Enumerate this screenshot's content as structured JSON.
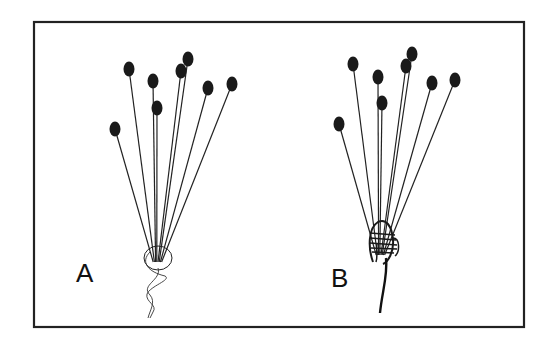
{
  "figure": {
    "panels": [
      {
        "label": "A",
        "description": "untied bundle of stalks with loose twisted thread",
        "base": [
          158,
          262
        ],
        "heads": [
          [
            115,
            129
          ],
          [
            129,
            69
          ],
          [
            153,
            81
          ],
          [
            157,
            108
          ],
          [
            181,
            71
          ],
          [
            188,
            59
          ],
          [
            208,
            88
          ],
          [
            232,
            84
          ]
        ]
      },
      {
        "label": "B",
        "description": "bundle of stalks wound and tied at base",
        "base": [
          381,
          255
        ],
        "heads": [
          [
            339,
            124
          ],
          [
            353,
            64
          ],
          [
            378,
            77
          ],
          [
            382,
            103
          ],
          [
            406,
            66
          ],
          [
            412,
            54
          ],
          [
            432,
            83
          ],
          [
            455,
            80
          ]
        ]
      }
    ],
    "colors": {
      "ink": "#1a1a1a",
      "frame": "#222222",
      "background": "#ffffff"
    }
  }
}
